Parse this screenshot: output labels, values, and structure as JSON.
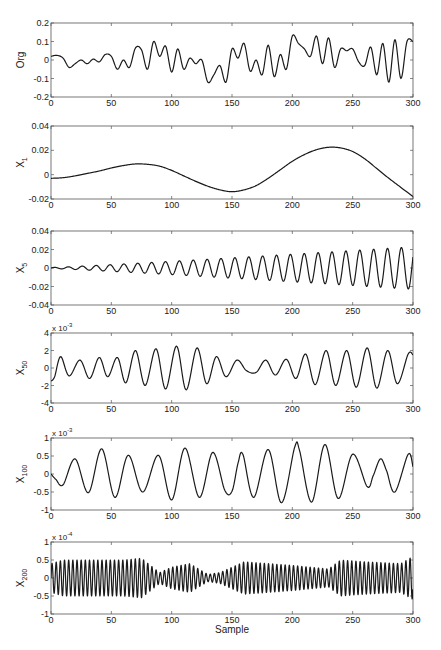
{
  "chart_data": [
    {
      "type": "line",
      "id": "org",
      "ylabel": "Org",
      "ylabel_sub": "",
      "exponent": "",
      "xlabel": "",
      "xlim": [
        0,
        300
      ],
      "ylim": [
        -0.2,
        0.2
      ],
      "xticks": [
        0,
        50,
        100,
        150,
        200,
        250,
        300
      ],
      "yticks": [
        -0.2,
        -0.1,
        0,
        0.1,
        0.2
      ],
      "ytick_labels": [
        "-0.2",
        "-0.1",
        "0",
        "0.1",
        "0.2"
      ],
      "box": [
        51,
        23,
        413,
        97
      ],
      "x": [
        0,
        5,
        10,
        15,
        20,
        25,
        30,
        35,
        40,
        45,
        50,
        55,
        60,
        65,
        70,
        75,
        80,
        85,
        90,
        95,
        100,
        105,
        110,
        115,
        120,
        125,
        130,
        135,
        140,
        145,
        150,
        155,
        160,
        165,
        170,
        175,
        180,
        185,
        190,
        195,
        200,
        205,
        210,
        215,
        220,
        225,
        230,
        235,
        240,
        245,
        250,
        255,
        260,
        265,
        270,
        275,
        280,
        285,
        290,
        295,
        300
      ],
      "values": [
        0.02,
        0.025,
        0.01,
        -0.04,
        -0.02,
        0.0,
        -0.02,
        0.005,
        -0.01,
        0.03,
        0.02,
        -0.05,
        0.0,
        -0.04,
        0.065,
        0.055,
        -0.05,
        0.1,
        0.02,
        0.075,
        -0.065,
        0.06,
        -0.05,
        0.01,
        -0.02,
        0.0,
        -0.12,
        -0.08,
        -0.03,
        -0.12,
        0.06,
        0.01,
        0.09,
        -0.06,
        0.0,
        -0.08,
        0.08,
        -0.09,
        0.03,
        -0.05,
        0.13,
        0.09,
        0.06,
        0.02,
        0.13,
        -0.02,
        0.12,
        -0.04,
        0.06,
        0.05,
        0.06,
        -0.01,
        -0.03,
        0.07,
        -0.08,
        0.09,
        -0.12,
        0.11,
        -0.1,
        0.1,
        0.1
      ]
    },
    {
      "type": "line",
      "id": "x1",
      "ylabel": "X",
      "ylabel_sub": "1",
      "exponent": "",
      "xlabel": "",
      "xlim": [
        0,
        300
      ],
      "ylim": [
        -0.02,
        0.04
      ],
      "xticks": [
        0,
        50,
        100,
        150,
        200,
        250,
        300
      ],
      "yticks": [
        -0.02,
        0,
        0.02,
        0.04
      ],
      "ytick_labels": [
        "-0.02",
        "0",
        "0.02",
        "0.04"
      ],
      "box": [
        51,
        126,
        413,
        199
      ],
      "x": [
        0,
        10,
        20,
        30,
        40,
        50,
        60,
        70,
        80,
        90,
        100,
        110,
        120,
        130,
        140,
        150,
        160,
        170,
        180,
        190,
        200,
        210,
        220,
        230,
        240,
        250,
        260,
        270,
        280,
        290,
        300
      ],
      "values": [
        -0.003,
        -0.0025,
        -0.001,
        0.001,
        0.003,
        0.0055,
        0.0075,
        0.0088,
        0.0085,
        0.007,
        0.0035,
        -0.001,
        -0.0055,
        -0.0095,
        -0.0125,
        -0.014,
        -0.0125,
        -0.009,
        -0.003,
        0.004,
        0.011,
        0.0165,
        0.0205,
        0.0225,
        0.022,
        0.019,
        0.013,
        0.005,
        -0.003,
        -0.0105,
        -0.018
      ]
    },
    {
      "type": "line",
      "id": "x5",
      "ylabel": "X",
      "ylabel_sub": "5",
      "exponent": "",
      "xlabel": "",
      "xlim": [
        0,
        300
      ],
      "ylim": [
        -0.04,
        0.04
      ],
      "xticks": [
        0,
        50,
        100,
        150,
        200,
        250,
        300
      ],
      "yticks": [
        -0.04,
        -0.02,
        0,
        0.02,
        0.04
      ],
      "ytick_labels": [
        "-0.04",
        "-0.02",
        "0",
        "0.02",
        "0.04"
      ],
      "box": [
        51,
        231,
        413,
        305
      ],
      "signal": {
        "kind": "growing_sine",
        "period": 11.5,
        "amp_start": 0.0005,
        "amp_end": 0.023,
        "phase": 0
      }
    },
    {
      "type": "line",
      "id": "x50",
      "ylabel": "X",
      "ylabel_sub": "50",
      "exponent": "x 10",
      "exponent_power": "-3",
      "xlabel": "",
      "xlim": [
        0,
        300
      ],
      "ylim": [
        -4,
        4
      ],
      "xticks": [
        0,
        50,
        100,
        150,
        200,
        250,
        300
      ],
      "yticks": [
        -4,
        -2,
        0,
        2,
        4
      ],
      "ytick_labels": [
        "-4",
        "-2",
        "0",
        "2",
        "4"
      ],
      "box": [
        51,
        333,
        413,
        403
      ],
      "x": [
        0,
        3,
        8,
        15,
        24,
        32,
        40,
        47,
        55,
        62,
        70,
        78,
        87,
        95,
        104,
        112,
        121,
        129,
        137,
        145,
        154,
        162,
        170,
        178,
        186,
        195,
        203,
        211,
        219,
        228,
        236,
        245,
        253,
        262,
        270,
        279,
        287,
        296,
        300
      ],
      "values": [
        -1.5,
        -1.0,
        1.3,
        -0.9,
        0.9,
        -1.2,
        1.2,
        -1.0,
        1.2,
        -1.7,
        2.0,
        -2.0,
        2.2,
        -2.4,
        2.5,
        -2.5,
        2.3,
        -1.8,
        1.3,
        -1.0,
        0.9,
        -0.3,
        -0.5,
        0.9,
        -0.8,
        1.0,
        -1.2,
        1.6,
        -1.9,
        2.0,
        -2.0,
        2.0,
        -2.2,
        2.3,
        -2.3,
        2.0,
        -1.8,
        1.6,
        1.5
      ]
    },
    {
      "type": "line",
      "id": "x100",
      "ylabel": "X",
      "ylabel_sub": "100",
      "exponent": "x 10",
      "exponent_power": "-3",
      "xlabel": "",
      "xlim": [
        0,
        300
      ],
      "ylim": [
        -1,
        1
      ],
      "xticks": [
        0,
        50,
        100,
        150,
        200,
        250,
        300
      ],
      "yticks": [
        -1,
        -0.5,
        0,
        0.5,
        1
      ],
      "ytick_labels": [
        "-1",
        "-0.5",
        "0",
        "0.5",
        "1"
      ],
      "box": [
        51,
        438,
        413,
        510
      ],
      "x": [
        0,
        4,
        10,
        20,
        31,
        42,
        53,
        64,
        76,
        89,
        100,
        111,
        123,
        134,
        144,
        150,
        155,
        159,
        168,
        180,
        191,
        202,
        206,
        216,
        227,
        238,
        250,
        262,
        267,
        273,
        278,
        285,
        296,
        300
      ],
      "values": [
        0.0,
        -0.15,
        -0.3,
        0.42,
        -0.52,
        0.7,
        -0.65,
        0.52,
        -0.5,
        0.52,
        -0.72,
        0.72,
        -0.65,
        0.6,
        -0.45,
        -0.48,
        0.3,
        0.55,
        -0.65,
        0.68,
        -0.8,
        0.75,
        0.65,
        -0.78,
        0.82,
        -0.68,
        0.55,
        -0.35,
        -0.05,
        0.42,
        0.1,
        -0.5,
        0.55,
        0.2
      ]
    },
    {
      "type": "line",
      "id": "x200",
      "ylabel": "X",
      "ylabel_sub": "200",
      "exponent": "x 10",
      "exponent_power": "-4",
      "xlabel": "Sample",
      "xlim": [
        0,
        300
      ],
      "ylim": [
        -1,
        1
      ],
      "xticks": [
        0,
        50,
        100,
        150,
        200,
        250,
        300
      ],
      "yticks": [
        -1,
        -0.5,
        0,
        0.5,
        1
      ],
      "ytick_labels": [
        "-1",
        "-0.5",
        "0",
        "0.5",
        "1"
      ],
      "box": [
        51,
        542,
        413,
        614
      ],
      "signal": {
        "kind": "modulated_sine",
        "period": 3.45,
        "envelope_x": [
          0,
          10,
          40,
          60,
          75,
          90,
          100,
          115,
          130,
          140,
          160,
          200,
          230,
          240,
          260,
          290,
          300
        ],
        "envelope_y": [
          0.4,
          0.5,
          0.5,
          0.5,
          0.55,
          0.15,
          0.3,
          0.4,
          0.1,
          0.15,
          0.45,
          0.35,
          0.25,
          0.5,
          0.45,
          0.4,
          0.6
        ]
      }
    }
  ],
  "figure": {
    "line_color": "#1a1a1a",
    "axis_color": "#555555",
    "background": "#ffffff"
  }
}
